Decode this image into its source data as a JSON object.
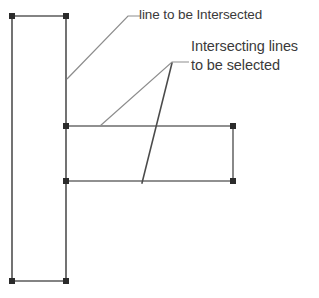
{
  "diagram": {
    "background_color": "#ffffff",
    "line_color": "#6b6b6b",
    "leader_color": "#8d8d8d",
    "grip_color": "#2b2b2b",
    "text_color": "#3a3a3a",
    "width": 319,
    "height": 298
  },
  "labels": {
    "intersected": "line to be Intersected",
    "selected_line1": "Intersecting lines",
    "selected_line2": "to be selected"
  },
  "shapes": {
    "vertical_rectangle": {
      "name": "line to be intersected",
      "left": 12,
      "top": 16,
      "right": 66,
      "bottom": 281
    },
    "horizontal_band": {
      "name": "intersecting lines",
      "left": 66,
      "top": 126,
      "right": 233,
      "bottom": 181
    },
    "slanted_line": {
      "name": "intersecting slanted line",
      "x1": 172,
      "y1": 63,
      "x2": 142,
      "y2": 183
    }
  },
  "leaders": {
    "intersected": {
      "anchor_x": 67,
      "anchor_y": 79,
      "elbow_x": 128,
      "elbow_y": 16,
      "end_x": 140,
      "end_y": 16
    },
    "selected": {
      "anchor_x": 100,
      "anchor_y": 126,
      "elbow_x": 172,
      "elbow_y": 62,
      "end_x": 189,
      "end_y": 62
    }
  },
  "grips": [
    {
      "name": "rect-top-left",
      "x": 12,
      "y": 16
    },
    {
      "name": "rect-top-right",
      "x": 66,
      "y": 16
    },
    {
      "name": "rect-bottom-left",
      "x": 12,
      "y": 281
    },
    {
      "name": "rect-bottom-right",
      "x": 66,
      "y": 281
    },
    {
      "name": "band-top-left",
      "x": 66,
      "y": 126
    },
    {
      "name": "band-bottom-left",
      "x": 66,
      "y": 181
    },
    {
      "name": "band-top-right",
      "x": 233,
      "y": 126
    },
    {
      "name": "band-bottom-right",
      "x": 233,
      "y": 181
    }
  ]
}
